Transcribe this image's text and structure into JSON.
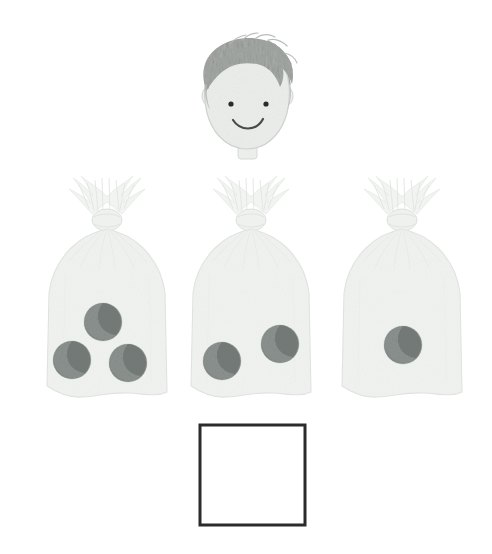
{
  "scene": {
    "title": "Marble bags counting problem",
    "background_color": "#ffffff",
    "width": 492,
    "height": 554
  },
  "character": {
    "name": "boy-head",
    "description": "Smiling boy's head with gray hair",
    "skin_color": "#eceeec",
    "hair_color": "#a9adaa",
    "outline_color": "#c9cdc9",
    "eye_color": "#2b2b2b",
    "mouth_color": "#4a4a4a",
    "eyes": 2,
    "expression": "smiling",
    "center_x": 247,
    "center_y": 100
  },
  "bags": {
    "label": "Bags of marbles",
    "bag_fill_color": "#f0f2f0",
    "bag_edge_color": "#dfe3df",
    "marble_color": "#8d9390",
    "marble_shadow_color": "#6f7572",
    "marble_radius": 19,
    "items": [
      {
        "name": "bag-1",
        "marble_count": 3,
        "count_label": "3",
        "x": 107,
        "marbles": [
          {
            "cx": 103,
            "cy": 322
          },
          {
            "cx": 72,
            "cy": 360
          },
          {
            "cx": 128,
            "cy": 363
          }
        ]
      },
      {
        "name": "bag-2",
        "marble_count": 2,
        "count_label": "2",
        "x": 251,
        "marbles": [
          {
            "cx": 222,
            "cy": 361
          },
          {
            "cx": 280,
            "cy": 344
          }
        ]
      },
      {
        "name": "bag-3",
        "marble_count": 1,
        "count_label": "1",
        "x": 402,
        "marbles": [
          {
            "cx": 403,
            "cy": 345
          }
        ]
      }
    ],
    "total_marbles": 6
  },
  "answer_box": {
    "name": "answer-box",
    "value": "",
    "placeholder": "",
    "border_color": "#2b2b2b",
    "fill_color": "#ffffff",
    "x": 200,
    "y": 425,
    "width": 105,
    "height": 100,
    "border_width": 3
  }
}
